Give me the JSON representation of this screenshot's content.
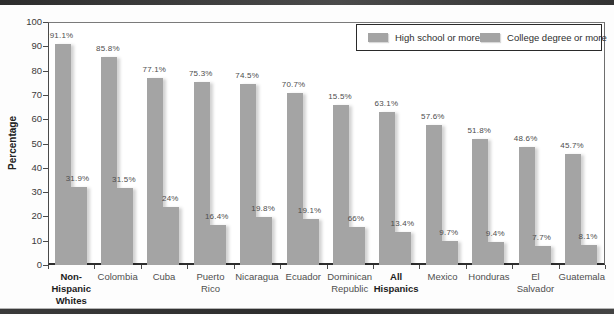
{
  "figure": {
    "band_color": "#3a3a3a",
    "bar_color": "#a4a4a4",
    "frame_color": "#4a4a4a"
  },
  "chart_data": {
    "type": "bar",
    "title": "",
    "xlabel": "",
    "ylabel": "Percentage",
    "ylim": [
      0,
      100
    ],
    "yticks": [
      0,
      10,
      20,
      30,
      40,
      50,
      60,
      70,
      80,
      90,
      100
    ],
    "grid": false,
    "legend_position": "top-right",
    "categories": [
      {
        "label": "Non-\nHispanic\nWhites",
        "bold": true
      },
      {
        "label": "Colombia",
        "bold": false
      },
      {
        "label": "Cuba",
        "bold": false
      },
      {
        "label": "Puerto\nRico",
        "bold": false
      },
      {
        "label": "Nicaragua",
        "bold": false
      },
      {
        "label": "Ecuador",
        "bold": false
      },
      {
        "label": "Dominican\nRepublic",
        "bold": false
      },
      {
        "label": "All\nHispanics",
        "bold": true
      },
      {
        "label": "Mexico",
        "bold": false
      },
      {
        "label": "Honduras",
        "bold": false
      },
      {
        "label": "El\nSalvador",
        "bold": false
      },
      {
        "label": "Guatemala",
        "bold": false
      }
    ],
    "series": [
      {
        "name": "High school or more",
        "color": "#a4a4a4",
        "values": [
          91.1,
          85.8,
          77.1,
          75.3,
          74.5,
          70.7,
          66,
          63.1,
          57.6,
          51.8,
          48.6,
          45.7
        ],
        "labels": [
          "91.1%",
          "85.8%",
          "77.1%",
          "75.3%",
          "74.5%",
          "70.7%",
          "15.5%",
          "63.1%",
          "57.6%",
          "51.8%",
          "48.6%",
          "45.7%"
        ]
      },
      {
        "name": "College degree or more",
        "color": "#a4a4a4",
        "values": [
          31.9,
          31.5,
          24,
          16.4,
          19.8,
          19.1,
          15.5,
          13.4,
          9.7,
          9.4,
          7.7,
          8.1
        ],
        "labels": [
          "31.9%",
          "31.5%",
          "24%",
          "16.4%",
          "19.8%",
          "19.1%",
          "66%",
          "13.4%",
          "9.7%",
          "9.4%",
          "7.7%",
          "8.1%"
        ]
      }
    ]
  }
}
